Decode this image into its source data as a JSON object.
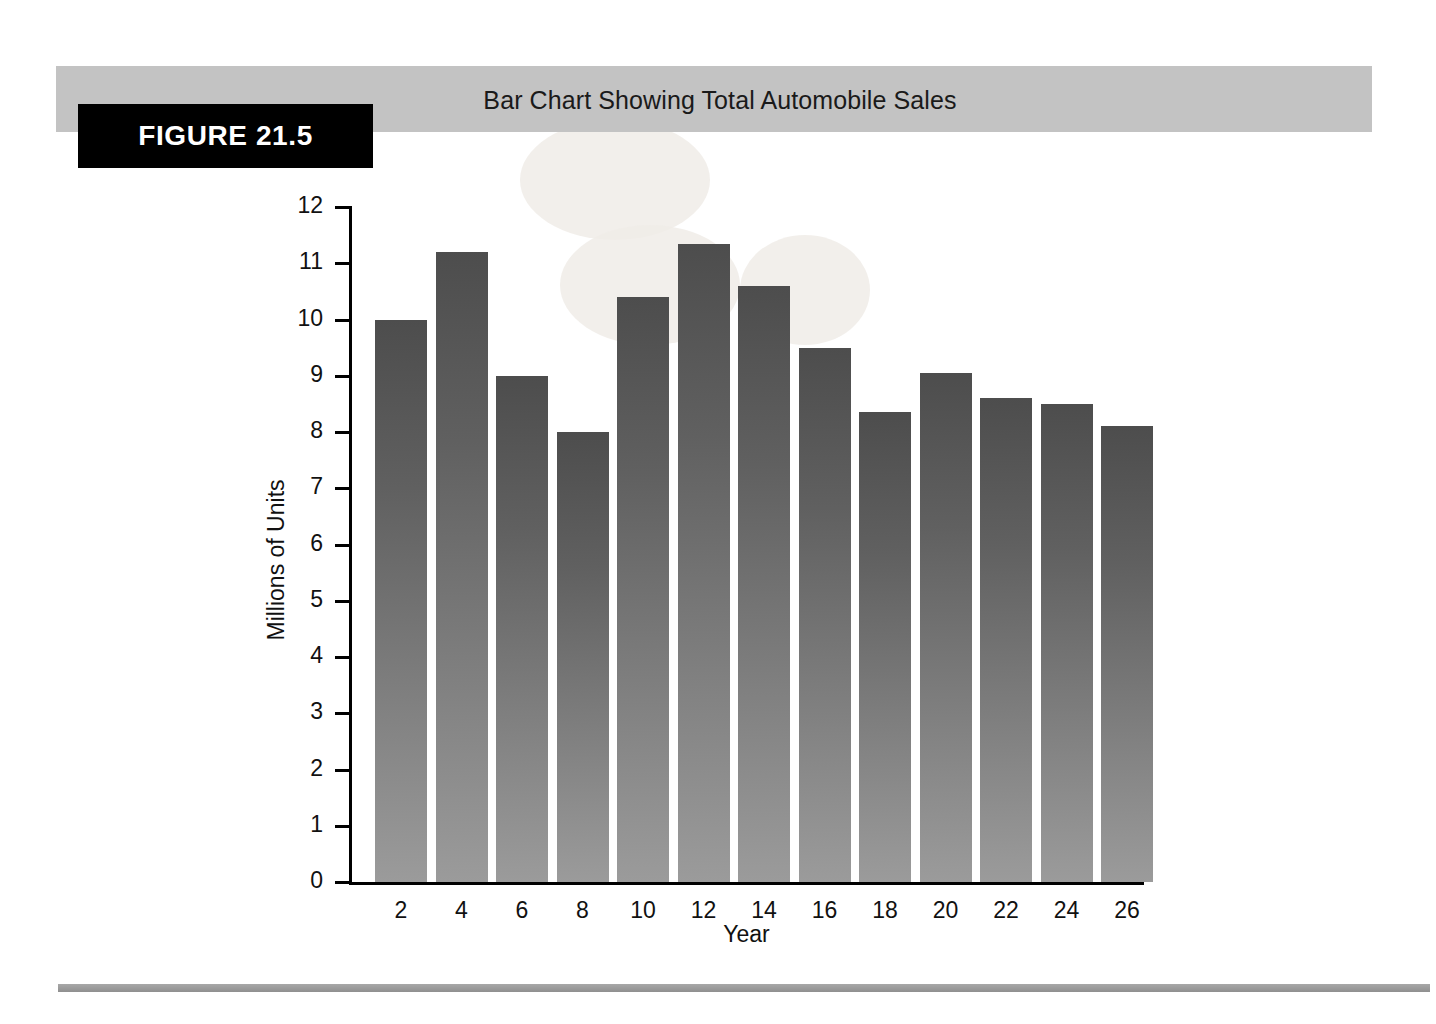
{
  "figure": {
    "tag": "FIGURE 21.5",
    "title": "Bar Chart Showing Total Automobile Sales"
  },
  "colors": {
    "header_band": "#c3c3c3",
    "tag_background": "#000000",
    "tag_text": "#ffffff",
    "bar_top": "#4d4d4d",
    "bar_bottom": "#9b9b9b",
    "axis": "#000000",
    "rule": "#9a9a9a"
  },
  "chart_data": {
    "type": "bar",
    "title": "Bar Chart Showing Total Automobile Sales",
    "xlabel": "Year",
    "ylabel": "Millions of Units",
    "categories": [
      "2",
      "4",
      "6",
      "8",
      "10",
      "12",
      "14",
      "16",
      "18",
      "20",
      "22",
      "24",
      "26"
    ],
    "values": [
      10.0,
      11.2,
      9.0,
      8.0,
      10.4,
      11.35,
      10.6,
      9.5,
      8.35,
      9.05,
      8.6,
      8.5,
      8.1
    ],
    "ylim": [
      0,
      12
    ],
    "yticks": [
      "12",
      "11",
      "10",
      "9",
      "8",
      "7",
      "6",
      "5",
      "4",
      "3",
      "2",
      "1",
      "0"
    ],
    "ytick_values": [
      12,
      11,
      10,
      9,
      8,
      7,
      6,
      5,
      4,
      3,
      2,
      1,
      0
    ],
    "xticks": [
      "2",
      "4",
      "6",
      "8",
      "10",
      "12",
      "14",
      "16",
      "18",
      "20",
      "22",
      "24",
      "26"
    ],
    "grid": false,
    "legend": null,
    "legend_position": "none"
  }
}
